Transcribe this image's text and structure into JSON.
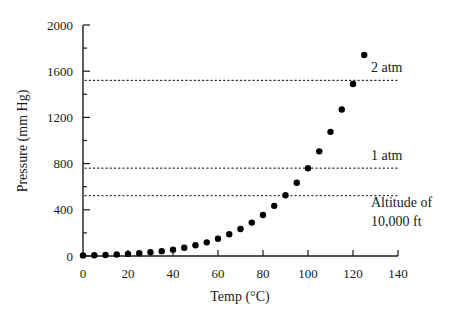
{
  "chart_data": {
    "type": "scatter",
    "title": "",
    "xlabel": "Temp (°C)",
    "ylabel": "Pressure (mm Hg)",
    "xlim": [
      0,
      140
    ],
    "ylim": [
      0,
      2000
    ],
    "xticks": [
      0,
      20,
      40,
      60,
      80,
      100,
      120,
      140
    ],
    "yticks": [
      0,
      400,
      800,
      1200,
      1600,
      2000
    ],
    "y_minor_tick_step": 200,
    "grid": false,
    "legend": null,
    "series": [
      {
        "name": "Vapor pressure of water",
        "x": [
          0,
          5,
          10,
          15,
          20,
          25,
          30,
          35,
          40,
          45,
          50,
          55,
          60,
          65,
          70,
          75,
          80,
          85,
          90,
          95,
          100,
          105,
          110,
          115,
          120,
          125
        ],
        "y": [
          5,
          7,
          9,
          13,
          18,
          24,
          32,
          42,
          55,
          72,
          93,
          118,
          149,
          188,
          234,
          289,
          355,
          434,
          526,
          634,
          760,
          906,
          1075,
          1268,
          1489,
          1740
        ]
      }
    ],
    "reference_lines": [
      {
        "y": 1520,
        "label": "2 atm",
        "style": "dotted"
      },
      {
        "y": 760,
        "label": "1 atm",
        "style": "dotted"
      },
      {
        "y": 523,
        "label": "Altitude of\n10,000 ft",
        "label_lines": [
          "Altitude of",
          "10,000 ft"
        ],
        "style": "dotted"
      }
    ],
    "colors": {
      "marker": "#000000",
      "axis": "#1a1a1a",
      "reference_line": "#333333"
    }
  }
}
